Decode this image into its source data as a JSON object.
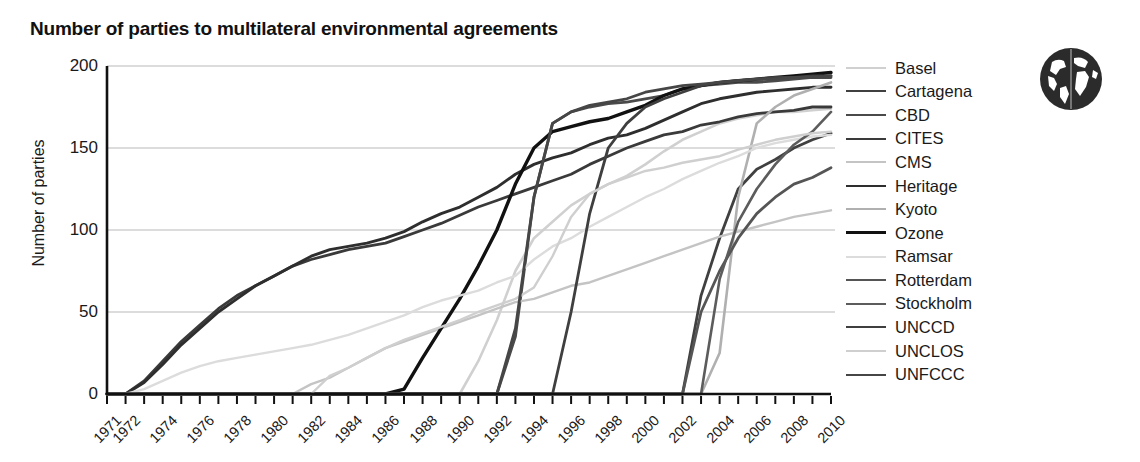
{
  "chart_title": "Number of parties to multilateral environmental agreements",
  "globe_icon": "globe-icon",
  "axes": {
    "ylabel": "Number of parties",
    "yticks": [
      "0",
      "50",
      "100",
      "150",
      "200"
    ],
    "xlabel": "",
    "xticks": [
      "1971",
      "1972",
      "1974",
      "1976",
      "1978",
      "1980",
      "1982",
      "1984",
      "1986",
      "1988",
      "1990",
      "1992",
      "1994",
      "1996",
      "1998",
      "2000",
      "2002",
      "2004",
      "2006",
      "2008",
      "2010"
    ]
  },
  "legend": {
    "position": "right",
    "items": [
      {
        "label": "Basel",
        "color": "#d0d0d0",
        "width": 2.6
      },
      {
        "label": "Cartagena",
        "color": "#404040",
        "width": 2.8
      },
      {
        "label": "CBD",
        "color": "#4a4a4a",
        "width": 2.8
      },
      {
        "label": "CITES",
        "color": "#3a3a3a",
        "width": 2.8
      },
      {
        "label": "CMS",
        "color": "#c4c4c4",
        "width": 2.4
      },
      {
        "label": "Heritage",
        "color": "#2e2e2e",
        "width": 2.9
      },
      {
        "label": "Kyoto",
        "color": "#b0b0b0",
        "width": 2.6
      },
      {
        "label": "Ozone",
        "color": "#111111",
        "width": 3.4
      },
      {
        "label": "Ramsar",
        "color": "#dcdcdc",
        "width": 2.4
      },
      {
        "label": "Rotterdam",
        "color": "#555555",
        "width": 2.8
      },
      {
        "label": "Stockholm",
        "color": "#5c5c5c",
        "width": 2.6
      },
      {
        "label": "UNCCD",
        "color": "#3f3f3f",
        "width": 2.8
      },
      {
        "label": "UNCLOS",
        "color": "#cfcfcf",
        "width": 2.4
      },
      {
        "label": "UNFCCC",
        "color": "#464646",
        "width": 2.8
      }
    ]
  },
  "chart_data": {
    "type": "line",
    "title": "Number of parties to multilateral environmental agreements",
    "xlabel": "",
    "ylabel": "Number of parties",
    "xlim": [
      1971,
      2010
    ],
    "ylim": [
      0,
      200
    ],
    "grid": "horizontal",
    "legend_position": "right",
    "x": [
      1971,
      1972,
      1973,
      1974,
      1975,
      1976,
      1977,
      1978,
      1979,
      1980,
      1981,
      1982,
      1983,
      1984,
      1985,
      1986,
      1987,
      1988,
      1989,
      1990,
      1991,
      1992,
      1993,
      1994,
      1995,
      1996,
      1997,
      1998,
      1999,
      2000,
      2001,
      2002,
      2003,
      2004,
      2005,
      2006,
      2007,
      2008,
      2009,
      2010
    ],
    "series": [
      {
        "name": "Basel",
        "color": "#d0d0d0",
        "values": [
          0,
          0,
          0,
          0,
          0,
          0,
          0,
          0,
          0,
          0,
          0,
          0,
          0,
          0,
          0,
          0,
          0,
          0,
          0,
          0,
          20,
          45,
          75,
          95,
          105,
          115,
          122,
          128,
          133,
          140,
          148,
          155,
          160,
          165,
          168,
          170,
          172,
          172,
          173,
          174
        ]
      },
      {
        "name": "Cartagena",
        "color": "#404040",
        "values": [
          0,
          0,
          0,
          0,
          0,
          0,
          0,
          0,
          0,
          0,
          0,
          0,
          0,
          0,
          0,
          0,
          0,
          0,
          0,
          0,
          0,
          0,
          0,
          0,
          0,
          0,
          0,
          0,
          0,
          0,
          0,
          0,
          60,
          95,
          125,
          137,
          143,
          150,
          155,
          159
        ]
      },
      {
        "name": "CBD",
        "color": "#4a4a4a",
        "values": [
          0,
          0,
          0,
          0,
          0,
          0,
          0,
          0,
          0,
          0,
          0,
          0,
          0,
          0,
          0,
          0,
          0,
          0,
          0,
          0,
          0,
          0,
          35,
          120,
          165,
          172,
          175,
          177,
          178,
          180,
          182,
          186,
          188,
          189,
          190,
          190,
          191,
          192,
          193,
          193
        ]
      },
      {
        "name": "CITES",
        "color": "#3a3a3a",
        "values": [
          0,
          0,
          8,
          20,
          32,
          42,
          52,
          60,
          66,
          72,
          78,
          82,
          85,
          88,
          90,
          92,
          96,
          100,
          104,
          109,
          114,
          118,
          122,
          126,
          130,
          134,
          140,
          145,
          150,
          154,
          158,
          160,
          164,
          166,
          169,
          171,
          172,
          173,
          175,
          175
        ]
      },
      {
        "name": "CMS",
        "color": "#c4c4c4",
        "values": [
          0,
          0,
          0,
          0,
          0,
          0,
          0,
          0,
          0,
          0,
          0,
          6,
          10,
          16,
          22,
          28,
          32,
          36,
          40,
          44,
          48,
          52,
          56,
          58,
          62,
          66,
          68,
          72,
          76,
          80,
          84,
          88,
          92,
          96,
          99,
          102,
          105,
          108,
          110,
          112
        ]
      },
      {
        "name": "Heritage",
        "color": "#2e2e2e",
        "values": [
          0,
          0,
          7,
          18,
          30,
          40,
          50,
          58,
          66,
          72,
          78,
          84,
          88,
          90,
          92,
          95,
          99,
          105,
          110,
          114,
          120,
          126,
          134,
          140,
          144,
          147,
          152,
          156,
          158,
          162,
          167,
          172,
          177,
          180,
          182,
          184,
          185,
          186,
          187,
          187
        ]
      },
      {
        "name": "Kyoto",
        "color": "#b0b0b0",
        "values": [
          0,
          0,
          0,
          0,
          0,
          0,
          0,
          0,
          0,
          0,
          0,
          0,
          0,
          0,
          0,
          0,
          0,
          0,
          0,
          0,
          0,
          0,
          0,
          0,
          0,
          0,
          0,
          0,
          0,
          0,
          0,
          0,
          0,
          25,
          120,
          165,
          175,
          182,
          186,
          190
        ]
      },
      {
        "name": "Ozone",
        "color": "#111111",
        "values": [
          0,
          0,
          0,
          0,
          0,
          0,
          0,
          0,
          0,
          0,
          0,
          0,
          0,
          0,
          0,
          0,
          3,
          22,
          40,
          58,
          78,
          100,
          128,
          150,
          160,
          163,
          166,
          168,
          172,
          176,
          182,
          186,
          188,
          190,
          191,
          192,
          193,
          194,
          195,
          196
        ]
      },
      {
        "name": "Ramsar",
        "color": "#dcdcdc",
        "values": [
          0,
          0,
          3,
          8,
          13,
          17,
          20,
          22,
          24,
          26,
          28,
          30,
          33,
          36,
          40,
          44,
          48,
          53,
          57,
          60,
          63,
          68,
          72,
          82,
          90,
          95,
          102,
          108,
          114,
          120,
          125,
          131,
          136,
          141,
          145,
          150,
          153,
          155,
          157,
          158
        ]
      },
      {
        "name": "Rotterdam",
        "color": "#555555",
        "values": [
          0,
          0,
          0,
          0,
          0,
          0,
          0,
          0,
          0,
          0,
          0,
          0,
          0,
          0,
          0,
          0,
          0,
          0,
          0,
          0,
          0,
          0,
          0,
          0,
          0,
          0,
          0,
          0,
          0,
          0,
          0,
          0,
          50,
          75,
          95,
          110,
          120,
          128,
          132,
          138
        ]
      },
      {
        "name": "Stockholm",
        "color": "#5c5c5c",
        "values": [
          0,
          0,
          0,
          0,
          0,
          0,
          0,
          0,
          0,
          0,
          0,
          0,
          0,
          0,
          0,
          0,
          0,
          0,
          0,
          0,
          0,
          0,
          0,
          0,
          0,
          0,
          0,
          0,
          0,
          0,
          0,
          0,
          0,
          70,
          105,
          125,
          140,
          152,
          160,
          172
        ]
      },
      {
        "name": "UNCCD",
        "color": "#3f3f3f",
        "values": [
          0,
          0,
          0,
          0,
          0,
          0,
          0,
          0,
          0,
          0,
          0,
          0,
          0,
          0,
          0,
          0,
          0,
          0,
          0,
          0,
          0,
          0,
          0,
          0,
          0,
          50,
          110,
          150,
          165,
          175,
          180,
          184,
          188,
          190,
          191,
          192,
          193,
          193,
          194,
          194
        ]
      },
      {
        "name": "UNCLOS",
        "color": "#cfcfcf",
        "values": [
          0,
          0,
          0,
          0,
          0,
          0,
          0,
          0,
          0,
          0,
          0,
          0,
          11,
          16,
          22,
          28,
          33,
          37,
          41,
          45,
          50,
          54,
          58,
          65,
          84,
          108,
          122,
          128,
          132,
          136,
          138,
          141,
          143,
          145,
          149,
          152,
          155,
          157,
          159,
          160
        ]
      },
      {
        "name": "UNFCCC",
        "color": "#464646",
        "values": [
          0,
          0,
          0,
          0,
          0,
          0,
          0,
          0,
          0,
          0,
          0,
          0,
          0,
          0,
          0,
          0,
          0,
          0,
          0,
          0,
          0,
          0,
          40,
          120,
          165,
          172,
          176,
          178,
          180,
          184,
          186,
          188,
          189,
          190,
          191,
          192,
          192,
          193,
          193,
          194
        ]
      }
    ]
  }
}
